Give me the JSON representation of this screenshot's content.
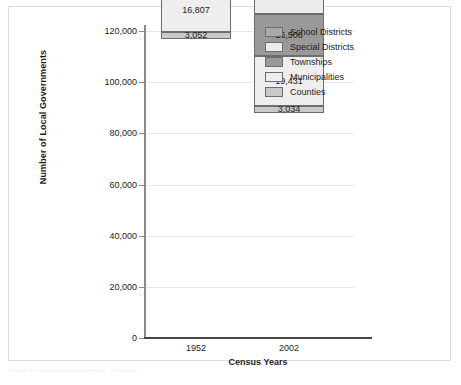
{
  "figure": {
    "footer_note": "FIGURE 13.2  Composition of Local Governments, 1952 and 2002"
  },
  "chart_data": {
    "type": "bar",
    "subtype": "stacked",
    "title": "",
    "xlabel": "Census Years",
    "ylabel": "Number of Local Governments",
    "categories": [
      "1952",
      "2002"
    ],
    "ylim": [
      0,
      120000
    ],
    "yticks": [
      0,
      20000,
      40000,
      60000,
      80000,
      100000,
      120000
    ],
    "ytick_labels": [
      "0",
      "20,000",
      "40,000",
      "60,000",
      "80,000",
      "100,000",
      "120,000"
    ],
    "grid": true,
    "legend_position": "upper right",
    "stack_order_bottom_to_top": [
      "Counties",
      "Municipalities",
      "Townships",
      "Special Districts",
      "School Districts"
    ],
    "series": [
      {
        "name": "School Districts",
        "color": "#a8a8a8",
        "values": [
          67355,
          13522
        ],
        "labels": [
          "67,355",
          "13,522"
        ]
      },
      {
        "name": "Special Districts",
        "color": "#ececec",
        "values": [
          12340,
          35356
        ],
        "labels": [
          "12,340",
          "35,356"
        ]
      },
      {
        "name": "Townships",
        "color": "#999999",
        "values": [
          17202,
          16506
        ],
        "labels": [
          "17,202",
          "16,506"
        ]
      },
      {
        "name": "Municipalities",
        "color": "#eeeeee",
        "values": [
          16807,
          19431
        ],
        "labels": [
          "16,807",
          "19,431"
        ]
      },
      {
        "name": "Counties",
        "color": "#c9c9c9",
        "values": [
          3052,
          3034
        ],
        "labels": [
          "3,052",
          "3,034"
        ]
      }
    ],
    "totals": [
      116756,
      87849
    ]
  },
  "legend": {
    "items": [
      {
        "label": "School Districts",
        "color": "#a8a8a8"
      },
      {
        "label": "Special Districts",
        "color": "#ececec"
      },
      {
        "label": "Townships",
        "color": "#999999"
      },
      {
        "label": "Municipalities",
        "color": "#eeeeee"
      },
      {
        "label": "Counties",
        "color": "#c9c9c9"
      }
    ]
  }
}
